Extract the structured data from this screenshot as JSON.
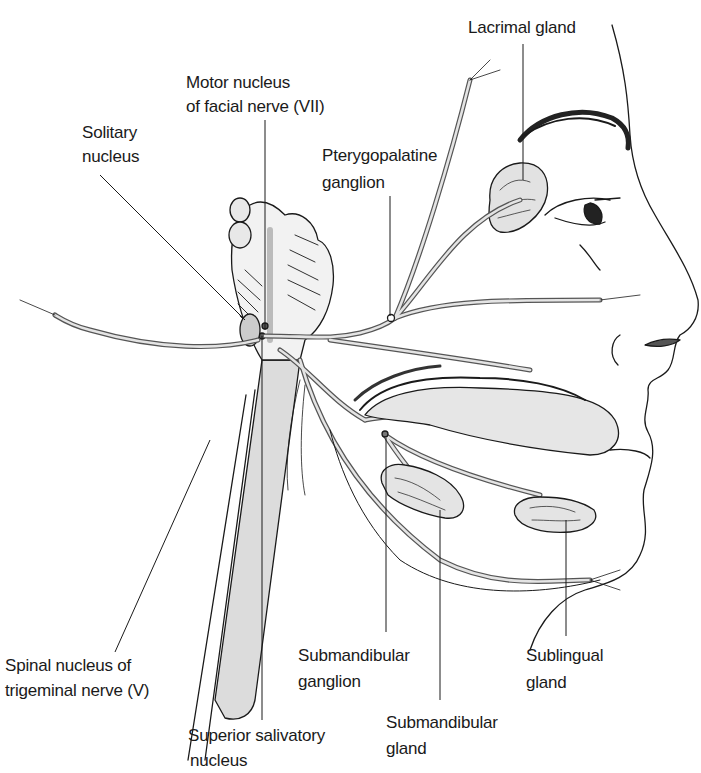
{
  "figure": {
    "labels": {
      "lacrimal_gland": "Lacrimal gland",
      "motor_nucleus_l1": "Motor nucleus",
      "motor_nucleus_l2": "of facial nerve (VII)",
      "solitary_l1": "Solitary",
      "solitary_l2": "nucleus",
      "pterygo_l1": "Pterygopalatine",
      "pterygo_l2": "ganglion",
      "spinal_l1": "Spinal nucleus of",
      "spinal_l2": "trigeminal nerve (V)",
      "submand_ganglion_l1": "Submandibular",
      "submand_ganglion_l2": "ganglion",
      "sublingual_l1": "Sublingual",
      "sublingual_l2": "gland",
      "submand_gland_l1": "Submandibular",
      "submand_gland_l2": "gland",
      "salivatory_l1": "Superior salivatory",
      "salivatory_l2": "nucleus"
    },
    "colors": {
      "line": "#1a1a1a",
      "nerve_fill": "#d9d9d9",
      "gland_fill": "#e0e0e0",
      "brainstem_fill": "#dcdcdc"
    }
  }
}
